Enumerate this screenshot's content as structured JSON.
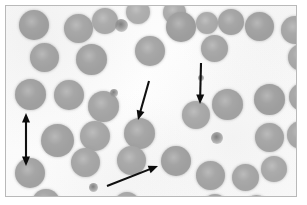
{
  "figure": {
    "border_color": "#b9b9b9",
    "background_color": "#fdfdfd",
    "cell_color": "#a5a5a5",
    "arrow_color": "#0c0c0c",
    "width": 307,
    "height": 205
  },
  "cells": [
    {
      "name": "erythrocyte",
      "x": 13,
      "y": 4,
      "d": 30,
      "shade": "#9e9e9e"
    },
    {
      "name": "erythrocyte",
      "x": 58,
      "y": 8,
      "d": 29,
      "shade": "#a3a3a3"
    },
    {
      "name": "erythrocyte",
      "x": 86,
      "y": 2,
      "d": 26,
      "shade": "#a8a8a8"
    },
    {
      "name": "erythrocyte",
      "x": 120,
      "y": -6,
      "d": 24,
      "shade": "#acacac"
    },
    {
      "name": "erythrocyte",
      "x": 157,
      "y": -5,
      "d": 23,
      "shade": "#aaaaaa"
    },
    {
      "name": "erythrocyte",
      "x": 160,
      "y": 6,
      "d": 30,
      "shade": "#9d9d9d"
    },
    {
      "name": "erythrocyte",
      "x": 190,
      "y": 6,
      "d": 22,
      "shade": "#a9a9a9"
    },
    {
      "name": "erythrocyte",
      "x": 212,
      "y": 3,
      "d": 26,
      "shade": "#a2a2a2"
    },
    {
      "name": "erythrocyte",
      "x": 239,
      "y": 6,
      "d": 29,
      "shade": "#9f9f9f"
    },
    {
      "name": "erythrocyte",
      "x": 275,
      "y": 10,
      "d": 28,
      "shade": "#a4a4a4"
    },
    {
      "name": "erythrocyte",
      "x": 24,
      "y": 37,
      "d": 29,
      "shade": "#a1a1a1"
    },
    {
      "name": "erythrocyte",
      "x": 70,
      "y": 38,
      "d": 31,
      "shade": "#a0a0a0"
    },
    {
      "name": "erythrocyte",
      "x": 129,
      "y": 30,
      "d": 30,
      "shade": "#a3a3a3"
    },
    {
      "name": "erythrocyte",
      "x": 195,
      "y": 29,
      "d": 27,
      "shade": "#a4a4a4"
    },
    {
      "name": "erythrocyte",
      "x": 282,
      "y": 38,
      "d": 27,
      "shade": "#a6a6a6"
    },
    {
      "name": "erythrocyte",
      "x": 9,
      "y": 73,
      "d": 31,
      "shade": "#9f9f9f"
    },
    {
      "name": "erythrocyte",
      "x": 48,
      "y": 74,
      "d": 30,
      "shade": "#a2a2a2"
    },
    {
      "name": "erythrocyte",
      "x": 82,
      "y": 85,
      "d": 31,
      "shade": "#a3a3a3"
    },
    {
      "name": "erythrocyte",
      "x": 176,
      "y": 95,
      "d": 28,
      "shade": "#a6a6a6"
    },
    {
      "name": "erythrocyte",
      "x": 206,
      "y": 83,
      "d": 31,
      "shade": "#a1a1a1"
    },
    {
      "name": "erythrocyte",
      "x": 248,
      "y": 78,
      "d": 31,
      "shade": "#9e9e9e"
    },
    {
      "name": "erythrocyte",
      "x": 283,
      "y": 77,
      "d": 28,
      "shade": "#a4a4a4"
    },
    {
      "name": "erythrocyte",
      "x": 35,
      "y": 118,
      "d": 33,
      "shade": "#a0a0a0"
    },
    {
      "name": "erythrocyte",
      "x": 74,
      "y": 115,
      "d": 30,
      "shade": "#a5a5a5"
    },
    {
      "name": "erythrocyte",
      "x": 118,
      "y": 112,
      "d": 31,
      "shade": "#a2a2a2"
    },
    {
      "name": "erythrocyte",
      "x": 249,
      "y": 117,
      "d": 29,
      "shade": "#a3a3a3"
    },
    {
      "name": "erythrocyte",
      "x": 281,
      "y": 115,
      "d": 28,
      "shade": "#a6a6a6"
    },
    {
      "name": "erythrocyte",
      "x": 9,
      "y": 152,
      "d": 30,
      "shade": "#a1a1a1"
    },
    {
      "name": "erythrocyte",
      "x": 65,
      "y": 142,
      "d": 29,
      "shade": "#a4a4a4"
    },
    {
      "name": "erythrocyte",
      "x": 111,
      "y": 140,
      "d": 29,
      "shade": "#a5a5a5"
    },
    {
      "name": "erythrocyte",
      "x": 155,
      "y": 140,
      "d": 30,
      "shade": "#9f9f9f"
    },
    {
      "name": "erythrocyte",
      "x": 190,
      "y": 155,
      "d": 29,
      "shade": "#a2a2a2"
    },
    {
      "name": "erythrocyte",
      "x": 226,
      "y": 158,
      "d": 27,
      "shade": "#a4a4a4"
    },
    {
      "name": "erythrocyte",
      "x": 255,
      "y": 150,
      "d": 26,
      "shade": "#a7a7a7"
    },
    {
      "name": "erythrocyte",
      "x": 26,
      "y": 183,
      "d": 28,
      "shade": "#a3a3a3"
    },
    {
      "name": "erythrocyte",
      "x": 108,
      "y": 186,
      "d": 26,
      "shade": "#a6a6a6"
    },
    {
      "name": "erythrocyte",
      "x": 196,
      "y": 188,
      "d": 26,
      "shade": "#a5a5a5"
    },
    {
      "name": "erythrocyte",
      "x": 238,
      "y": 189,
      "d": 25,
      "shade": "#a7a7a7"
    }
  ],
  "platelets": [
    {
      "name": "platelet",
      "x": 109,
      "y": 13,
      "d": 13,
      "lobed": true
    },
    {
      "name": "platelet",
      "x": 104,
      "y": 83,
      "d": 8,
      "lobed": false
    },
    {
      "name": "platelet",
      "x": 205,
      "y": 126,
      "d": 12,
      "lobed": false
    },
    {
      "name": "platelet",
      "x": 83,
      "y": 177,
      "d": 9,
      "lobed": false
    },
    {
      "name": "platelet",
      "x": 192,
      "y": 69,
      "d": 6,
      "lobed": false
    }
  ],
  "annotations": [
    {
      "id": "size-reference-arrow",
      "type": "double-headed-vertical-arrow",
      "label": "Cell diameter size reference (double-headed arrow)",
      "x1": 20,
      "y1": 107,
      "x2": 20,
      "y2": 160
    },
    {
      "id": "center-pointer-arrow",
      "type": "single-headed-arrow",
      "label": "Arrow indicating central erythrocyte",
      "x1": 143,
      "y1": 75,
      "x2": 132,
      "y2": 114
    },
    {
      "id": "right-pointer-arrow",
      "type": "single-headed-arrow",
      "label": "Arrow indicating right-side erythrocyte",
      "x1": 195,
      "y1": 57,
      "x2": 194,
      "y2": 98
    },
    {
      "id": "diagonal-pointer-arrow",
      "type": "single-headed-arrow",
      "label": "Diagonal arrow indicating lower-centre erythrocyte",
      "x1": 101,
      "y1": 180,
      "x2": 152,
      "y2": 160
    }
  ]
}
